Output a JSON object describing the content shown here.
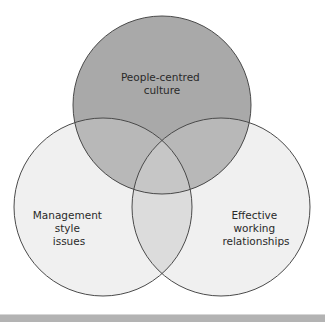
{
  "diagram": {
    "type": "venn",
    "circles": [
      {
        "id": "top",
        "label_lines": [
          "People-centred",
          "culture"
        ],
        "fill": "#a9a9a9",
        "stroke": "#4a4a4a"
      },
      {
        "id": "left",
        "label_lines": [
          "Management",
          "style",
          "issues"
        ],
        "fill": "#f0f0f0",
        "stroke": "#4a4a4a"
      },
      {
        "id": "right",
        "label_lines": [
          "Effective",
          "working",
          "relationships"
        ],
        "fill": "#f0f0f0",
        "stroke": "#4a4a4a"
      }
    ],
    "overlap_colors": {
      "top_with_lower": "#b8b8b8",
      "left_right": "#dcdcdc",
      "center": "#c6c6c6"
    },
    "bottom_bar_color": "#b3b3b3"
  }
}
